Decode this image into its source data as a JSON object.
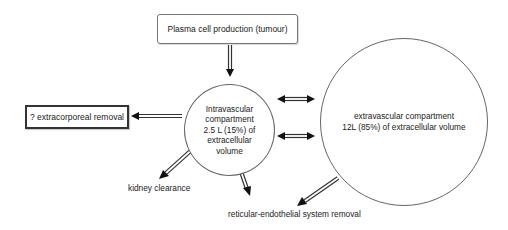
{
  "diagram": {
    "type": "flow",
    "nodes": {
      "production": {
        "label": "Plasma cell production (tumour)"
      },
      "intravascular": {
        "lines": [
          "Intravascular",
          "compartment",
          "2.5 L (15%) of",
          "extracellular",
          "volume"
        ]
      },
      "extravascular": {
        "lines": [
          "extravascular compartment",
          "12L (85%) of extracellular volume"
        ]
      },
      "extracorporeal": {
        "label": "? extracorporeal removal"
      },
      "kidney": {
        "label": "kidney clearance"
      },
      "res": {
        "label": "reticular-endothelial system removal"
      }
    },
    "edges": [
      {
        "from": "production",
        "to": "intravascular",
        "style": "hollow-arrow"
      },
      {
        "from": "intravascular",
        "to": "extracorporeal",
        "style": "hollow-arrow"
      },
      {
        "from": "intravascular",
        "to": "extravascular",
        "style": "double-headed",
        "count": 2
      },
      {
        "from": "intravascular",
        "to": "kidney",
        "style": "hollow-arrow"
      },
      {
        "from": "intravascular",
        "to": "res",
        "style": "hollow-arrow"
      },
      {
        "from": "extravascular",
        "to": "res",
        "style": "hollow-arrow"
      }
    ],
    "colors": {
      "stroke": "#333333",
      "background": "#ffffff",
      "text": "#222222"
    }
  }
}
